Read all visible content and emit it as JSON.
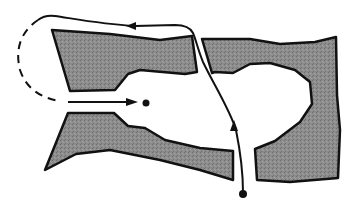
{
  "diagram": {
    "description": "Schematic of a channel between two shaded tissue masses; a solid path enters from bottom, travels up through a gap, loops left across the top and returns via a dashed segment into a central cavity ending at a dot.",
    "colors": {
      "background": "#ffffff",
      "mass_fill": "#8a8a8a",
      "outline": "#111111",
      "path": "#111111"
    },
    "elements": [
      {
        "id": "left-mass",
        "label": "Left shaded mass"
      },
      {
        "id": "right-mass",
        "label": "Right shaded mass"
      },
      {
        "id": "central-cavity",
        "label": "Central cavity"
      },
      {
        "id": "solid-path",
        "label": "Solid route path"
      },
      {
        "id": "dashed-path",
        "label": "Dashed return path"
      },
      {
        "id": "start-dot",
        "label": "Start point (bottom)"
      },
      {
        "id": "end-dot",
        "label": "End point (cavity)"
      }
    ]
  }
}
